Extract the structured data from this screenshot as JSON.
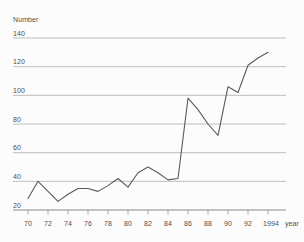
{
  "page": {
    "background": "#fcfcfc",
    "width": 304,
    "height": 242
  },
  "chart_data": {
    "type": "line",
    "title": "",
    "ylabel": "Number",
    "xlabel": "year",
    "x": [
      1970,
      1971,
      1972,
      1973,
      1974,
      1975,
      1976,
      1977,
      1978,
      1979,
      1980,
      1981,
      1982,
      1983,
      1984,
      1985,
      1986,
      1987,
      1988,
      1989,
      1990,
      1991,
      1992,
      1993,
      1994
    ],
    "values": [
      28,
      40,
      33,
      26,
      31,
      35,
      35,
      33,
      37,
      42,
      36,
      46,
      50,
      46,
      41,
      42,
      98,
      90,
      80,
      72,
      106,
      102,
      121,
      126,
      130
    ],
    "x_ticks": [
      1970,
      1972,
      1974,
      1976,
      1978,
      1980,
      1982,
      1984,
      1986,
      1988,
      1990,
      1992,
      1994
    ],
    "x_tick_labels": [
      "70",
      "72",
      "74",
      "76",
      "78",
      "80",
      "82",
      "84",
      "86",
      "88",
      "90",
      "92",
      "1994"
    ],
    "y_ticks": [
      20,
      40,
      60,
      80,
      100,
      120,
      140
    ],
    "y_tick_labels": [
      "20",
      "40",
      "60",
      "80",
      "100",
      "120",
      "140"
    ],
    "xlim": [
      1970,
      1994
    ],
    "ylim": [
      20,
      140
    ],
    "grid": true,
    "legend": null,
    "colors": {
      "line": "#5a5a5a",
      "grid": "#a3a3a3",
      "axis": "#8c8c8c",
      "text": "#4f4f4f",
      "background": "#fcfcfc"
    }
  }
}
